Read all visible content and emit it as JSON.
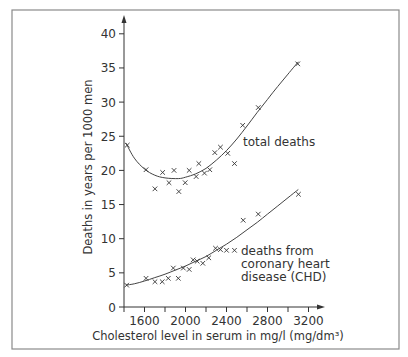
{
  "chart_data": {
    "type": "scatter",
    "title": "",
    "xlabel": "Cholesterol level in serum in mg/l (mg/dm³)",
    "ylabel": "Deaths in years per 1000 men",
    "xlim": [
      1400,
      3350
    ],
    "ylim": [
      0,
      42
    ],
    "x_ticks_major": [
      1600,
      2000,
      2400,
      2800,
      3200
    ],
    "x_ticks_minor": [
      1400,
      1800,
      2200,
      2600,
      3000
    ],
    "y_ticks": [
      0,
      5,
      10,
      15,
      20,
      25,
      30,
      35,
      40
    ],
    "grid": false,
    "legend": "none (inline annotations)",
    "series": [
      {
        "name": "total deaths",
        "label_lines": [
          "total deaths"
        ],
        "marker": "x",
        "points": [
          [
            1432,
            23.7
          ],
          [
            1615,
            20.1
          ],
          [
            1702,
            17.3
          ],
          [
            1777,
            19.7
          ],
          [
            1839,
            18.2
          ],
          [
            1888,
            20.0
          ],
          [
            1935,
            16.9
          ],
          [
            1997,
            18.2
          ],
          [
            2036,
            20.0
          ],
          [
            2104,
            19.1
          ],
          [
            2130,
            21.0
          ],
          [
            2185,
            19.6
          ],
          [
            2237,
            20.1
          ],
          [
            2286,
            22.6
          ],
          [
            2341,
            23.4
          ],
          [
            2412,
            22.5
          ],
          [
            2478,
            21.0
          ],
          [
            2558,
            26.6
          ],
          [
            2710,
            29.2
          ],
          [
            3095,
            35.6
          ]
        ],
        "fit_curve": [
          [
            1420,
            24.0
          ],
          [
            1500,
            21.8
          ],
          [
            1600,
            20.2
          ],
          [
            1700,
            19.3
          ],
          [
            1800,
            18.9
          ],
          [
            1930,
            18.8
          ],
          [
            2000,
            19.0
          ],
          [
            2100,
            19.5
          ],
          [
            2200,
            20.3
          ],
          [
            2300,
            21.5
          ],
          [
            2400,
            22.9
          ],
          [
            2500,
            24.6
          ],
          [
            2600,
            26.5
          ],
          [
            2700,
            28.5
          ],
          [
            2800,
            30.4
          ],
          [
            2900,
            32.3
          ],
          [
            3000,
            34.1
          ],
          [
            3100,
            35.9
          ]
        ]
      },
      {
        "name": "deaths from coronary heart disease (CHD)",
        "label_lines": [
          "deaths from",
          "coronary heart",
          "disease (CHD)"
        ],
        "marker": "x",
        "points": [
          [
            1426,
            3.2
          ],
          [
            1615,
            4.2
          ],
          [
            1702,
            3.7
          ],
          [
            1773,
            3.7
          ],
          [
            1832,
            4.2
          ],
          [
            1881,
            5.7
          ],
          [
            1930,
            4.2
          ],
          [
            1979,
            5.7
          ],
          [
            2036,
            5.5
          ],
          [
            2075,
            6.9
          ],
          [
            2114,
            6.7
          ],
          [
            2169,
            6.4
          ],
          [
            2227,
            7.2
          ],
          [
            2293,
            8.6
          ],
          [
            2341,
            8.4
          ],
          [
            2400,
            8.3
          ],
          [
            2478,
            8.3
          ],
          [
            2563,
            12.7
          ],
          [
            2710,
            13.6
          ],
          [
            3102,
            16.5
          ]
        ],
        "fit_curve": [
          [
            1420,
            3.2
          ],
          [
            1500,
            3.4
          ],
          [
            1600,
            3.8
          ],
          [
            1700,
            4.3
          ],
          [
            1800,
            4.8
          ],
          [
            1900,
            5.4
          ],
          [
            2000,
            6.0
          ],
          [
            2100,
            6.7
          ],
          [
            2200,
            7.4
          ],
          [
            2300,
            8.3
          ],
          [
            2400,
            9.2
          ],
          [
            2500,
            10.2
          ],
          [
            2600,
            11.3
          ],
          [
            2700,
            12.4
          ],
          [
            2800,
            13.6
          ],
          [
            2900,
            14.8
          ],
          [
            3000,
            16.0
          ],
          [
            3100,
            17.2
          ]
        ]
      }
    ]
  },
  "labels": {
    "x_axis": "Cholesterol level in serum in mg/l (mg/dm³)",
    "y_axis": "Deaths in years per 1000 men",
    "total_deaths": "total deaths",
    "chd_line1": "deaths from",
    "chd_line2": "coronary heart",
    "chd_line3": "disease (CHD)"
  }
}
